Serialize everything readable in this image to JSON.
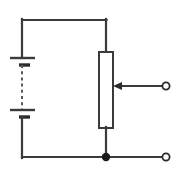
{
  "figure": {
    "type": "schematic-diagram",
    "width": 181,
    "height": 175,
    "background_color": "#ffffff",
    "line_color": "#3a3a3a",
    "fill_color": "#ffffff",
    "junction_color": "#1a1a1a"
  },
  "components": {
    "battery": {
      "name": "battery",
      "cells": 2,
      "dashed_separator": true,
      "plates": [
        {
          "label": "cell-1-positive-plate",
          "kind": "long",
          "x1": 10,
          "x2": 35,
          "y": 58
        },
        {
          "label": "cell-1-negative-plate",
          "kind": "short",
          "x1": 19,
          "x2": 30,
          "y": 65
        },
        {
          "label": "cell-2-positive-plate",
          "kind": "long",
          "x1": 10,
          "x2": 35,
          "y": 110
        },
        {
          "label": "cell-2-negative-plate",
          "kind": "short",
          "x1": 19,
          "x2": 30,
          "y": 117
        }
      ],
      "terminal_x": 22,
      "top_lead_y1": 20,
      "top_lead_y2": 58,
      "bottom_lead_y1": 117,
      "bottom_lead_y2": 157,
      "dash_y1": 65,
      "dash_y2": 110
    },
    "potentiometer": {
      "name": "potentiometer",
      "body": {
        "x": 99,
        "y": 52,
        "width": 14,
        "height": 76
      },
      "top_lead": {
        "x": 106,
        "y1": 20,
        "y2": 52
      },
      "bottom_lead": {
        "x": 106,
        "y1": 128,
        "y2": 157
      },
      "wiper": {
        "name": "wiper-arrow",
        "y": 86,
        "x_tip": 113,
        "x_tail": 163,
        "direction": "left",
        "arrow_head_length": 9,
        "arrow_head_half_width": 4
      }
    },
    "wires": [
      {
        "name": "top-wire",
        "x1": 22,
        "y1": 20,
        "x2": 106,
        "y2": 20
      },
      {
        "name": "bottom-wire",
        "x1": 22,
        "y1": 157,
        "x2": 163,
        "y2": 157
      }
    ],
    "junction": {
      "name": "junction-node",
      "cx": 106,
      "cy": 157,
      "r": 4.2
    },
    "terminals": [
      {
        "name": "wiper-output-terminal",
        "cx": 166,
        "cy": 86,
        "r": 3.6
      },
      {
        "name": "common-output-terminal",
        "cx": 166,
        "cy": 157,
        "r": 3.6
      }
    ]
  }
}
